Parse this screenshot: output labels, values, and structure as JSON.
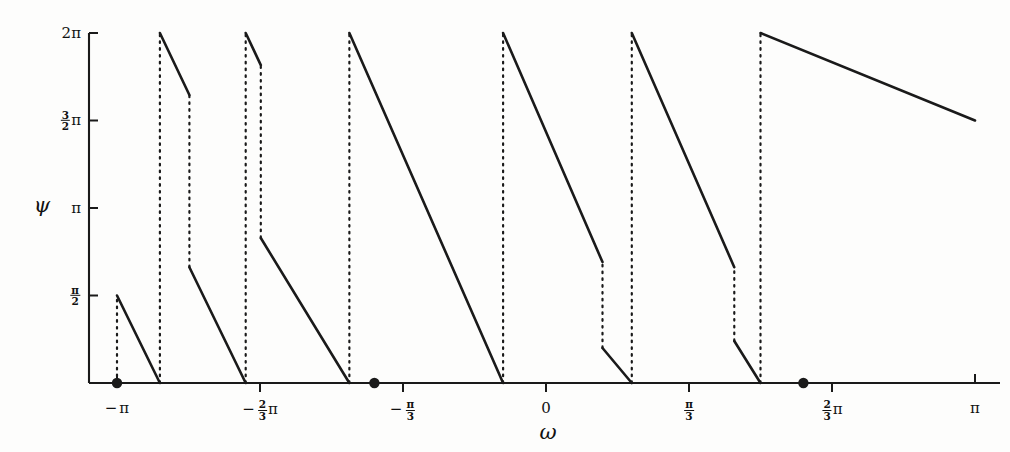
{
  "figure": {
    "kind": "phase-plot",
    "background": "#fdfdfc",
    "line_color": "#1a1a1a",
    "axis_color": "#1a1a1a"
  },
  "axes": {
    "x": {
      "name": "ω",
      "name_label": "omega-axis-label",
      "min": -3.141592653589793,
      "max": 3.141592653589793,
      "ticks": [
        {
          "value": -3.141592653589793,
          "label": "-π",
          "kind": "plain"
        },
        {
          "value": -2.0943951023931953,
          "label": "-2/3 π",
          "kind": "frac",
          "num": "2",
          "den": "3",
          "neg": true
        },
        {
          "value": -1.0471975511965976,
          "label": "-π/3",
          "kind": "fracpi",
          "num": "π",
          "den": "3",
          "neg": true
        },
        {
          "value": 0.0,
          "label": "0",
          "kind": "plain"
        },
        {
          "value": 1.0471975511965976,
          "label": "π/3",
          "kind": "fracpi",
          "num": "π",
          "den": "3",
          "neg": false
        },
        {
          "value": 2.0943951023931953,
          "label": "2/3 π",
          "kind": "frac",
          "num": "2",
          "den": "3",
          "neg": false
        },
        {
          "value": 3.141592653589793,
          "label": "π",
          "kind": "plain"
        }
      ]
    },
    "y": {
      "name": "ψ",
      "name_label": "psi-axis-label",
      "min": 0.0,
      "max": 6.283185307179586,
      "ticks": [
        {
          "value": 6.283185307179586,
          "label": "2π",
          "kind": "plain"
        },
        {
          "value": 4.71238898038469,
          "label": "3/2 π",
          "kind": "frac",
          "num": "3",
          "den": "2"
        },
        {
          "value": 3.141592653589793,
          "label": "π",
          "kind": "plain"
        },
        {
          "value": 1.5707963267948966,
          "label": "π/2",
          "kind": "fracpi",
          "num": "π",
          "den": "2"
        }
      ]
    }
  },
  "chart_data": {
    "type": "line",
    "title": "",
    "xlabel": "ω",
    "ylabel": "ψ",
    "xlim": [
      -3.141592653589793,
      3.141592653589793
    ],
    "ylim": [
      0.0,
      6.283185307179586
    ],
    "grid": false,
    "legend": null,
    "segments": [
      {
        "name": "branch-1",
        "style": "solid",
        "x": [
          -3.141592653589793,
          -2.827433388230814
        ],
        "y": [
          1.5707963267948966,
          0.0
        ]
      },
      {
        "name": "branch-2",
        "style": "solid",
        "x": [
          -2.827433388230814,
          -2.611395536484588
        ],
        "y": [
          6.283185307179586,
          5.169537088785849
        ]
      },
      {
        "name": "branch-3",
        "style": "solid",
        "x": [
          -2.611395536484588,
          -2.199114857512855
        ],
        "y": [
          2.0787265870648604,
          0.0
        ]
      },
      {
        "name": "branch-4",
        "style": "solid",
        "x": [
          -2.199114857512855,
          -2.0884955592153878
        ],
        "y": [
          6.283185307179586,
          5.707226654021178
        ]
      },
      {
        "name": "branch-5",
        "style": "solid",
        "x": [
          -2.0884955592153878,
          -1.4399345545571416
        ],
        "y": [
          2.602704922760191,
          0.0
        ]
      },
      {
        "name": "branch-6",
        "style": "solid",
        "x": [
          -1.4399345545571416,
          -0.3141592653589793
        ],
        "y": [
          6.283185307179586,
          0.0
        ]
      },
      {
        "name": "branch-7",
        "style": "solid",
        "x": [
          -0.3141592653589793,
          0.4137166941154068
        ],
        "y": [
          6.283185307179586,
          2.170970897287564
        ]
      },
      {
        "name": "branch-8",
        "style": "solid",
        "x": [
          0.4137166941154068,
          0.6283185307179586
        ],
        "y": [
          0.6283185307179586,
          0.0
        ]
      },
      {
        "name": "branch-9",
        "style": "solid",
        "x": [
          0.6283185307179586,
          1.3788101090755203
        ],
        "y": [
          6.283185307179586,
          2.0787265870648604
        ]
      },
      {
        "name": "branch-10",
        "style": "solid",
        "x": [
          1.3788101090755203,
          1.5707963267948966
        ],
        "y": [
          0.7539822368615503,
          0.0
        ]
      },
      {
        "name": "branch-11",
        "style": "solid",
        "x": [
          1.5707963267948966,
          3.141592653589793
        ],
        "y": [
          6.283185307179586,
          4.71238898038469
        ]
      }
    ],
    "jumps": [
      {
        "name": "jump-1",
        "style": "dotted",
        "x": -3.141592653589793,
        "y": [
          0.0,
          1.5707963267948966
        ]
      },
      {
        "name": "jump-2",
        "style": "dotted",
        "x": -2.827433388230814,
        "y": [
          0.0,
          6.283185307179586
        ]
      },
      {
        "name": "jump-3",
        "style": "dotted",
        "x": -2.611395536484588,
        "y": [
          2.0787265870648604,
          5.169537088785849
        ]
      },
      {
        "name": "jump-4",
        "style": "dotted",
        "x": -2.199114857512855,
        "y": [
          0.0,
          6.283185307179586
        ]
      },
      {
        "name": "jump-5",
        "style": "dotted",
        "x": -2.0884955592153878,
        "y": [
          2.602704922760191,
          5.707226654021178
        ]
      },
      {
        "name": "jump-6",
        "style": "dotted",
        "x": -1.4399345545571416,
        "y": [
          0.0,
          6.283185307179586
        ]
      },
      {
        "name": "jump-7",
        "style": "dotted",
        "x": -0.3141592653589793,
        "y": [
          0.0,
          6.283185307179586
        ]
      },
      {
        "name": "jump-8",
        "style": "dotted",
        "x": 0.4137166941154068,
        "y": [
          0.6283185307179586,
          2.170970897287564
        ]
      },
      {
        "name": "jump-9",
        "style": "dotted",
        "x": 0.6283185307179586,
        "y": [
          0.0,
          6.283185307179586
        ]
      },
      {
        "name": "jump-10",
        "style": "dotted",
        "x": 1.3788101090755203,
        "y": [
          0.7539822368615503,
          2.0787265870648604
        ]
      },
      {
        "name": "jump-11",
        "style": "dotted",
        "x": 1.5707963267948966,
        "y": [
          0.0,
          6.283185307179586
        ]
      }
    ],
    "markers": [
      {
        "name": "marker-1",
        "x": -3.141592653589793,
        "y": 0.0,
        "shape": "filled-circle"
      },
      {
        "name": "marker-2",
        "x": -1.2566370614359172,
        "y": 0.0,
        "shape": "filled-circle"
      },
      {
        "name": "marker-3",
        "x": 1.884955592153876,
        "y": 0.0,
        "shape": "filled-circle"
      }
    ]
  }
}
